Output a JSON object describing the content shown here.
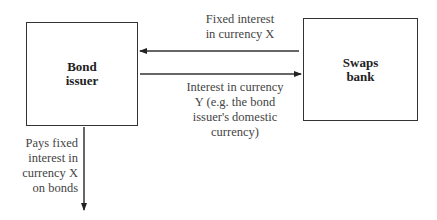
{
  "diagram": {
    "nodes": [
      {
        "id": "bond_issuer",
        "label_line1": "Bond",
        "label_line2": "issuer"
      },
      {
        "id": "swaps_bank",
        "label_line1": "Swaps",
        "label_line2": "bank"
      }
    ],
    "edges": [
      {
        "from": "swaps_bank",
        "to": "bond_issuer",
        "label_lines": [
          "Fixed interest",
          "in currency X"
        ]
      },
      {
        "from": "bond_issuer",
        "to": "swaps_bank",
        "label_lines": [
          "Interest in currency",
          "Y (e.g. the bond",
          "issuer's domestic",
          "currency)"
        ]
      },
      {
        "from": "bond_issuer",
        "to": "bondholders",
        "label_lines": [
          "Pays fixed",
          "interest in",
          "currency X",
          "on bonds"
        ]
      }
    ],
    "colors": {
      "line": "#333333",
      "text": "#444444",
      "background": "#ffffff"
    }
  }
}
